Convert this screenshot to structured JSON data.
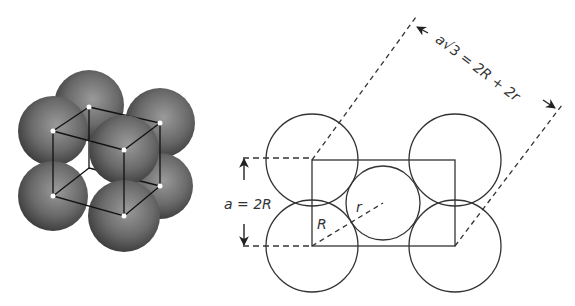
{
  "figure": {
    "left_panel": {
      "description": "Body-centered cubic unit cell with shaded atoms",
      "atom_color": "#5a5a5a",
      "highlight_color": "#ffffff"
    },
    "right_panel": {
      "description": "Body diagonal section through BCC cell",
      "labels": {
        "edge_length": "a = 2R",
        "diagonal": "a√3 = 2R + 2r",
        "diagonal_a": "a",
        "diagonal_sqrt": "√3",
        "diagonal_rhs": " = 2R + 2r",
        "large_radius": "R",
        "small_radius": "r"
      },
      "line_color": "#333333"
    }
  }
}
